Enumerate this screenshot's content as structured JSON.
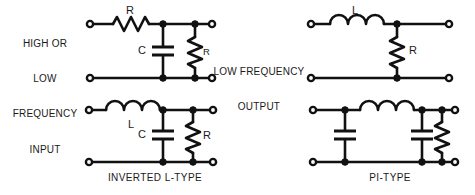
{
  "figure": {
    "title_present": false,
    "background_color": "#ffffff",
    "ink_color": "#111111",
    "style": "scanned-textbook-line-art"
  },
  "annotations": {
    "input_label": "HIGH OR\nLOW\nFREQUENCY\nINPUT",
    "input_label_lines": [
      "HIGH OR",
      "LOW",
      "FREQUENCY",
      "INPUT"
    ],
    "output_label_lines": [
      "LOW FREQUENCY",
      "OUTPUT"
    ],
    "output_label": "LOW FREQUENCY OUTPUT"
  },
  "circuits": [
    {
      "id": "top-left",
      "name": "l-type-filter",
      "caption": "",
      "components": [
        {
          "type": "resistor",
          "label": "R",
          "orientation": "horizontal",
          "position": "series-top"
        },
        {
          "type": "capacitor",
          "label": "C",
          "orientation": "vertical",
          "position": "shunt"
        },
        {
          "type": "resistor",
          "label": "R",
          "orientation": "vertical",
          "position": "shunt-load"
        }
      ],
      "terminals": {
        "input": 2,
        "output": 2
      }
    },
    {
      "id": "top-right",
      "name": "l-type-inductive-filter",
      "caption": "",
      "components": [
        {
          "type": "inductor",
          "label": "L",
          "orientation": "horizontal",
          "position": "series-top"
        },
        {
          "type": "resistor",
          "label": "R",
          "orientation": "vertical",
          "position": "shunt-load"
        }
      ],
      "terminals": {
        "input": 2,
        "output": 2
      }
    },
    {
      "id": "bottom-left",
      "name": "inverted-l-type-filter",
      "caption": "INVERTED L-TYPE",
      "components": [
        {
          "type": "inductor",
          "label": "L",
          "orientation": "horizontal",
          "position": "series-top"
        },
        {
          "type": "capacitor",
          "label": "C",
          "orientation": "vertical",
          "position": "shunt"
        },
        {
          "type": "resistor",
          "label": "R",
          "orientation": "vertical",
          "position": "shunt-load"
        }
      ],
      "terminals": {
        "input": 2,
        "output": 2
      }
    },
    {
      "id": "bottom-right",
      "name": "pi-type-filter",
      "caption": "PI-TYPE",
      "components": [
        {
          "type": "capacitor",
          "label": "",
          "orientation": "vertical",
          "position": "shunt-input"
        },
        {
          "type": "inductor",
          "label": "",
          "orientation": "horizontal",
          "position": "series-top"
        },
        {
          "type": "capacitor",
          "label": "",
          "orientation": "vertical",
          "position": "shunt-output"
        },
        {
          "type": "resistor",
          "label": "",
          "orientation": "vertical",
          "position": "shunt-load"
        }
      ],
      "terminals": {
        "input": 2,
        "output": 2
      }
    }
  ],
  "labels": {
    "tl_r_series": "R",
    "tl_c_shunt": "C",
    "tl_r_load": "R",
    "tr_l_series": "L",
    "tr_r_load": "R",
    "bl_l_series": "L",
    "bl_c_shunt": "C",
    "bl_r_load": "R",
    "caption_bl": "INVERTED L-TYPE",
    "caption_br": "PI-TYPE"
  }
}
